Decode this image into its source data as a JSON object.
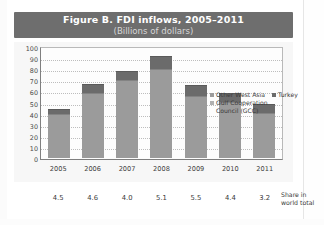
{
  "figure": {
    "title": "Figure B. FDI inflows, 2005–2011",
    "subtitle": "(Billions of dollars)",
    "share_label_line1": "Share in",
    "share_label_line2": "world total"
  },
  "colors": {
    "banner": "#6e6e6e",
    "turkey": "#6b6b6b",
    "other_west_asia": "#9b9b9b",
    "gcc": "#9b9b9b",
    "plot_background": "#fdfdfd",
    "chart_background": "#f7f7f7"
  },
  "chart_data": {
    "type": "bar",
    "stacked": true,
    "title": "Figure B. FDI inflows, 2005–2011",
    "subtitle": "(Billions of dollars)",
    "xlabel": "",
    "ylabel": "",
    "ylim": [
      0,
      100
    ],
    "yticks": [
      0,
      10,
      20,
      30,
      40,
      50,
      60,
      70,
      80,
      90,
      100
    ],
    "grid": true,
    "legend_position": "inside-top-right",
    "categories": [
      "2005",
      "2006",
      "2007",
      "2008",
      "2009",
      "2010",
      "2011"
    ],
    "series": [
      {
        "name": "Gulf Cooperation Council (GCC)",
        "values": [
          29.0,
          38.0,
          47.5,
          60.5,
          47.0,
          40.5,
          26.0
        ]
      },
      {
        "name": "Other West Asia",
        "values": [
          11.0,
          21.0,
          22.5,
          19.5,
          9.0,
          10.0,
          15.0
        ]
      },
      {
        "name": "Turkey",
        "values": [
          4.5,
          8.0,
          8.5,
          12.0,
          10.0,
          8.0,
          8.0
        ]
      }
    ],
    "totals": [
      44.5,
      67.0,
      78.5,
      92.0,
      66.0,
      58.5,
      49.0
    ],
    "share_in_world_total": [
      "4.5",
      "4.6",
      "4.0",
      "5.1",
      "5.5",
      "4.4",
      "3.2"
    ]
  },
  "legend": {
    "items": [
      {
        "label": "Other West Asia",
        "key": "other"
      },
      {
        "label": "Turkey",
        "key": "turkey"
      },
      {
        "label": "Gulf Cooperation",
        "key": "gcc"
      },
      {
        "label": "Council (GCC)",
        "key": "none"
      }
    ]
  }
}
